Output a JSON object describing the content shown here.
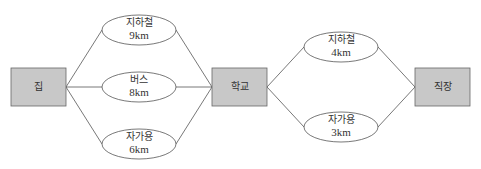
{
  "colors": {
    "box_fill": "#c8c8c8",
    "box_stroke": "#666666",
    "line": "#555555",
    "oval_fill": "#ffffff"
  },
  "nodes": {
    "home": {
      "label": "집"
    },
    "school": {
      "label": "학교"
    },
    "work": {
      "label": "직장"
    }
  },
  "routes_home_school": [
    {
      "mode": "지하철",
      "distance": "9km"
    },
    {
      "mode": "버스",
      "distance": "8km"
    },
    {
      "mode": "자가용",
      "distance": "6km"
    }
  ],
  "routes_school_work": [
    {
      "mode": "지하철",
      "distance": "4km"
    },
    {
      "mode": "자가용",
      "distance": "3km"
    }
  ]
}
